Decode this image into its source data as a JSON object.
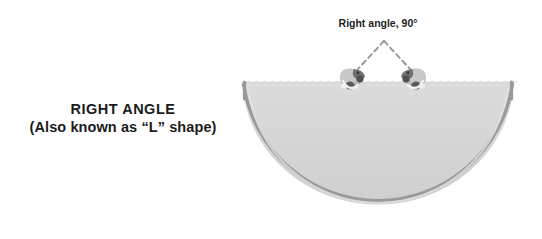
{
  "figure": {
    "title_lines": [
      "RIGHT ANGLE",
      "(Also known as “L” shape)"
    ],
    "annotation": "Right angle, 90°",
    "angle_degrees": 90,
    "colors": {
      "background": "#ffffff",
      "bowl_fill": "#d6d6d6",
      "bowl_rim": "#9a9a9a",
      "bowl_edge_light": "#e2e2e2",
      "dashed_line": "#9b9b9b",
      "text": "#1b1b1b",
      "figure_dark": "#6f6f6f",
      "figure_mid": "#9d9d9d",
      "figure_light": "#c9c9c9",
      "figure_white": "#f4f4f4"
    },
    "shape": {
      "type": "semicircle-bowl",
      "rim_left_x": 243,
      "rim_right_x": 513,
      "rim_y": 82,
      "bottom_y": 219
    },
    "markers": [
      {
        "name": "left-figure",
        "x": 352,
        "y": 76
      },
      {
        "name": "right-figure",
        "x": 414,
        "y": 76
      }
    ],
    "angle_vertex": {
      "x": 384,
      "y": 41
    }
  }
}
